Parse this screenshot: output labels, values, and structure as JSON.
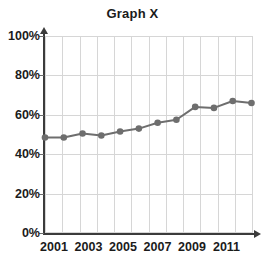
{
  "chart_data": {
    "type": "line",
    "title": "Graph X",
    "xlabel": "",
    "ylabel": "",
    "x": [
      2001,
      2002,
      2003,
      2004,
      2005,
      2006,
      2007,
      2008,
      2009,
      2010,
      2011,
      2012
    ],
    "values": [
      48.5,
      48.5,
      50.5,
      49.5,
      51.5,
      53,
      56,
      57.5,
      64,
      63.5,
      67,
      66
    ],
    "series": [
      {
        "name": "Graph X",
        "values": [
          48.5,
          48.5,
          50.5,
          49.5,
          51.5,
          53,
          56,
          57.5,
          64,
          63.5,
          67,
          66
        ]
      }
    ],
    "ylim": [
      0,
      100
    ],
    "xlim": [
      2001,
      2012
    ],
    "ytick_labels": [
      "0%",
      "20%",
      "40%",
      "60%",
      "80%",
      "100%"
    ],
    "ytick_values": [
      0,
      20,
      40,
      60,
      80,
      100
    ],
    "xtick_labels": [
      "2001",
      "2003",
      "2005",
      "2007",
      "2009",
      "2011"
    ],
    "xtick_values": [
      2001,
      2003,
      2005,
      2007,
      2009,
      2011
    ],
    "grid": true,
    "legend": "none",
    "units": "percent",
    "line_color": "#6e6e6e",
    "marker_color": "#6e6e6e",
    "grid_color": "#d6d6d6",
    "axis_color": "#3b3b3b",
    "text_color": "#1b1b1b",
    "background": "#ffffff"
  }
}
